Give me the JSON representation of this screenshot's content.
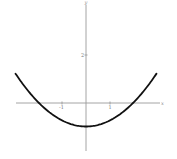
{
  "chart_data": {
    "type": "line",
    "title": "",
    "function": "y = x^2/4 - 1",
    "xlabel": "x",
    "ylabel": "y",
    "xlim": [
      -3,
      3
    ],
    "ylim": [
      -1.9,
      4.1
    ],
    "grid": false,
    "legend": null,
    "x_ticks": [
      {
        "value": -1,
        "label": "-1"
      },
      {
        "value": 1,
        "label": "1"
      }
    ],
    "y_ticks": [
      {
        "value": 2,
        "label": "2"
      }
    ],
    "series": [
      {
        "name": "parabola",
        "color": "#111111",
        "x": [
          -3,
          -2.5,
          -2,
          -1.5,
          -1,
          -0.5,
          0,
          0.5,
          1,
          1.5,
          2,
          2.5,
          3
        ],
        "y": [
          1.25,
          0.5625,
          0,
          -0.4375,
          -0.75,
          -0.9375,
          -1,
          -0.9375,
          -0.75,
          -0.4375,
          0,
          0.5625,
          1.25
        ]
      }
    ],
    "annotations": {
      "vertex": {
        "x": 0,
        "y": -1
      },
      "x_intercepts": [
        -2,
        2
      ]
    }
  },
  "labels": {
    "x_axis": "x",
    "y_axis": "y",
    "tick_neg1": "-1",
    "tick_pos1": "1",
    "tick_y2": "2"
  },
  "colors": {
    "axis": "#9a9a9a",
    "curve": "#111111",
    "background": "#ffffff"
  }
}
